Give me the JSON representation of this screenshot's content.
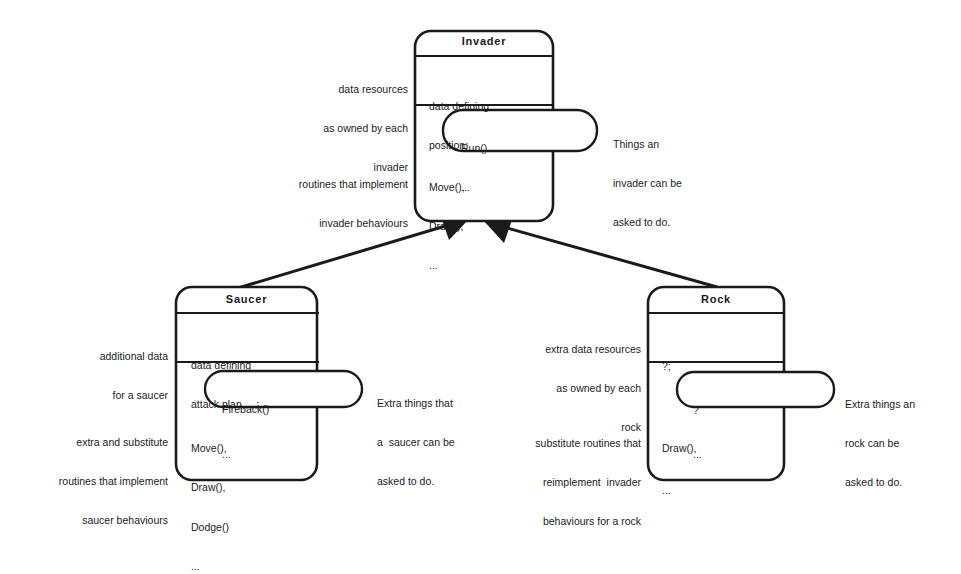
{
  "diagram": {
    "type": "class-inheritance",
    "colors": {
      "stroke": "#1a1a1a",
      "background": "#ffffff"
    },
    "classes": {
      "invader": {
        "name": "Invader",
        "data_lines": [
          "data defining",
          "position;"
        ],
        "interface_lines": [
          "Run()",
          "..."
        ],
        "method_lines": [
          "Move(),",
          "Draw(),",
          "..."
        ],
        "annotation_data": [
          "data resources",
          "as owned by each",
          "invader"
        ],
        "annotation_methods": [
          "routines that implement",
          "invader behaviours"
        ],
        "annotation_interface": [
          "Things an",
          "invader can be",
          "asked to do."
        ]
      },
      "saucer": {
        "name": "Saucer",
        "data_lines": [
          "data defining",
          "attack plan, ...;"
        ],
        "interface_lines": [
          "Fireback()",
          "..."
        ],
        "method_lines": [
          "Move(),",
          "Draw(),",
          "Dodge()",
          "..."
        ],
        "annotation_data": [
          "additional data",
          "for a saucer"
        ],
        "annotation_methods": [
          "extra and substitute",
          "routines that implement",
          "saucer behaviours"
        ],
        "annotation_interface": [
          "Extra things that",
          "a  saucer can be",
          "asked to do."
        ]
      },
      "rock": {
        "name": "Rock",
        "data_lines": [
          "?;"
        ],
        "interface_lines": [
          "?",
          "..."
        ],
        "method_lines": [
          "Draw(),",
          "..."
        ],
        "annotation_data": [
          "extra data resources",
          "as owned by each",
          "rock"
        ],
        "annotation_methods": [
          "substitute routines that",
          "reimplement  invader",
          "behaviours for a rock"
        ],
        "annotation_interface": [
          "Extra things an",
          "rock can be",
          "asked to do."
        ]
      }
    },
    "relations": [
      {
        "from": "Saucer",
        "to": "Invader",
        "kind": "inherits"
      },
      {
        "from": "Rock",
        "to": "Invader",
        "kind": "inherits"
      }
    ]
  }
}
